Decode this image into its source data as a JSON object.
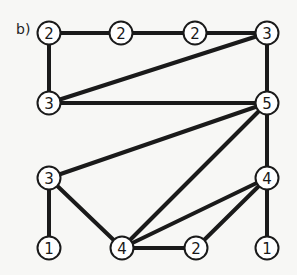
{
  "figure": {
    "label": "b)",
    "edge_color": "#1a1a1a",
    "node_fill": "#ffffff",
    "node_stroke": "#1a1a1a",
    "text_color": "#1a1a1a",
    "background": "#f7f7f5"
  },
  "graph": {
    "nodes": [
      {
        "id": "n1",
        "label": "2",
        "x": 49,
        "y": 33
      },
      {
        "id": "n2",
        "label": "2",
        "x": 121,
        "y": 33
      },
      {
        "id": "n3",
        "label": "2",
        "x": 195,
        "y": 33
      },
      {
        "id": "n4",
        "label": "3",
        "x": 267,
        "y": 33
      },
      {
        "id": "n5",
        "label": "3",
        "x": 49,
        "y": 103
      },
      {
        "id": "n6",
        "label": "5",
        "x": 267,
        "y": 103
      },
      {
        "id": "n7",
        "label": "3",
        "x": 49,
        "y": 178
      },
      {
        "id": "n8",
        "label": "4",
        "x": 267,
        "y": 178
      },
      {
        "id": "n9",
        "label": "1",
        "x": 49,
        "y": 248
      },
      {
        "id": "n10",
        "label": "4",
        "x": 122,
        "y": 248
      },
      {
        "id": "n11",
        "label": "2",
        "x": 196,
        "y": 248
      },
      {
        "id": "n12",
        "label": "1",
        "x": 267,
        "y": 248
      }
    ],
    "edges": [
      [
        "n1",
        "n2"
      ],
      [
        "n2",
        "n3"
      ],
      [
        "n3",
        "n4"
      ],
      [
        "n1",
        "n5"
      ],
      [
        "n5",
        "n4"
      ],
      [
        "n5",
        "n6"
      ],
      [
        "n4",
        "n6"
      ],
      [
        "n6",
        "n7"
      ],
      [
        "n6",
        "n10"
      ],
      [
        "n6",
        "n8"
      ],
      [
        "n8",
        "n10"
      ],
      [
        "n8",
        "n11"
      ],
      [
        "n8",
        "n12"
      ],
      [
        "n10",
        "n11"
      ],
      [
        "n7",
        "n10"
      ],
      [
        "n7",
        "n9"
      ]
    ]
  }
}
